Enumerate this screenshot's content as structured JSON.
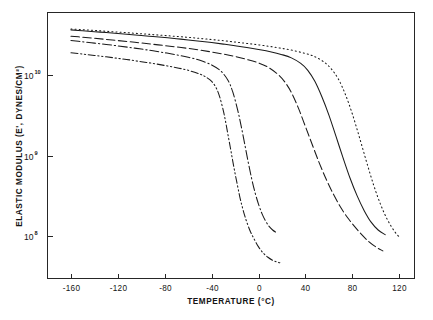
{
  "chart_data": {
    "type": "line",
    "title": "",
    "xlabel": "TEMPERATURE  (°C)",
    "ylabel": "ELASTIC MODULUS (E', DYNES/CM²)",
    "xlim": [
      -180,
      133
    ],
    "ylim": [
      30000000.0,
      60000000000.0
    ],
    "yscale": "log",
    "grid": false,
    "legend": "none",
    "xticks": [
      -160,
      -120,
      -80,
      -40,
      0,
      40,
      80,
      120
    ],
    "xtick_labels": [
      "-160",
      "-120",
      "-80",
      "-40",
      "0",
      "40",
      "80",
      "120"
    ],
    "yticks": [
      10000000000.0,
      1000000000.0,
      100000000.0
    ],
    "ytick_labels": [
      "10¹⁰",
      "10⁹",
      "10⁸"
    ],
    "ytick_base": "10",
    "ytick_exponents": [
      "10",
      "9",
      "8"
    ],
    "series": [
      {
        "name": "curve-1-dash-dot-dot",
        "style": "dash-dot-dot",
        "dasharray": "7,2.6,1.3,2.6,1.3,2.6",
        "x": [
          -160,
          -150,
          -140,
          -130,
          -120,
          -110,
          -100,
          -90,
          -80,
          -70,
          -60,
          -50,
          -45,
          -40,
          -36,
          -33,
          -30,
          -28,
          -26,
          -24,
          -22,
          -20,
          -18,
          -16,
          -14,
          -12,
          -10,
          -7,
          -4,
          0,
          4,
          8,
          12,
          16,
          20
        ],
        "y": [
          19000000000.0,
          18300000000.0,
          17600000000.0,
          16900000000.0,
          16200000000.0,
          15500000000.0,
          14700000000.0,
          14000000000.0,
          13200000000.0,
          12400000000.0,
          11500000000.0,
          10300000000.0,
          9500000000.0,
          8400000000.0,
          6900000000.0,
          5300000000.0,
          3600000000.0,
          2600000000.0,
          1800000000.0,
          1250000000.0,
          860000000.0,
          600000000.0,
          430000000.0,
          310000000.0,
          235000000.0,
          185000000.0,
          150000000.0,
          115000000.0,
          94000000.0,
          74000000.0,
          62000000.0,
          55000000.0,
          50500000.0,
          48000000.0,
          46500000.0
        ]
      },
      {
        "name": "curve-2-dash-dot",
        "style": "dash-dot",
        "dasharray": "9,2.8,1.3,2.8",
        "x": [
          -160,
          -150,
          -140,
          -130,
          -120,
          -110,
          -100,
          -90,
          -80,
          -70,
          -60,
          -50,
          -40,
          -32,
          -26,
          -22,
          -18,
          -15,
          -12,
          -9,
          -6,
          -3,
          0,
          3,
          6,
          9,
          12,
          15
        ],
        "y": [
          27000000000.0,
          26000000000.0,
          25000000000.0,
          24100000000.0,
          23100000000.0,
          22100000000.0,
          21100000000.0,
          20100000000.0,
          19000000000.0,
          17900000000.0,
          16700000000.0,
          15300000000.0,
          13400000000.0,
          11200000000.0,
          8600000000.0,
          6200000000.0,
          3800000000.0,
          2400000000.0,
          1450000000.0,
          860000000.0,
          530000000.0,
          350000000.0,
          250000000.0,
          190000000.0,
          155000000.0,
          133000000.0,
          120000000.0,
          112000000.0
        ]
      },
      {
        "name": "curve-3-dashed",
        "style": "dashed",
        "dasharray": "8.5,3.4",
        "x": [
          -160,
          -150,
          -140,
          -130,
          -120,
          -110,
          -100,
          -90,
          -80,
          -70,
          -60,
          -50,
          -40,
          -30,
          -20,
          -10,
          0,
          8,
          16,
          22,
          28,
          34,
          40,
          46,
          52,
          58,
          64,
          70,
          76,
          82,
          88,
          94,
          100,
          106
        ],
        "y": [
          30500000000.0,
          29600000000.0,
          28700000000.0,
          27800000000.0,
          26900000000.0,
          26000000000.0,
          25100000000.0,
          24200000000.0,
          23300000000.0,
          22400000000.0,
          21500000000.0,
          20500000000.0,
          19400000000.0,
          18300000000.0,
          17100000000.0,
          15700000000.0,
          14200000000.0,
          12600000000.0,
          10400000000.0,
          8400000000.0,
          6100000000.0,
          3900000000.0,
          2300000000.0,
          1350000000.0,
          800000000.0,
          500000000.0,
          330000000.0,
          230000000.0,
          170000000.0,
          132000000.0,
          105000000.0,
          86000000.0,
          74000000.0,
          66000000.0
        ]
      },
      {
        "name": "curve-4-solid",
        "style": "solid",
        "dasharray": "0",
        "x": [
          -160,
          -150,
          -140,
          -130,
          -120,
          -110,
          -100,
          -90,
          -80,
          -70,
          -60,
          -50,
          -40,
          -30,
          -20,
          -10,
          0,
          10,
          20,
          28,
          36,
          42,
          48,
          54,
          60,
          66,
          72,
          78,
          84,
          90,
          96,
          102,
          108
        ],
        "y": [
          36500000000.0,
          35600000000.0,
          34700000000.0,
          33800000000.0,
          32900000000.0,
          32000000000.0,
          31100000000.0,
          30200000000.0,
          29300000000.0,
          28400000000.0,
          27400000000.0,
          26400000000.0,
          25400000000.0,
          24300000000.0,
          23200000000.0,
          22100000000.0,
          20900000000.0,
          19600000000.0,
          18000000000.0,
          16400000000.0,
          14000000000.0,
          11500000000.0,
          8400000000.0,
          5400000000.0,
          3200000000.0,
          1750000000.0,
          950000000.0,
          530000000.0,
          320000000.0,
          210000000.0,
          150000000.0,
          120000000.0,
          105000000.0
        ]
      },
      {
        "name": "curve-5-dotted",
        "style": "dotted",
        "dasharray": "1.1,3.0",
        "x": [
          -160,
          -150,
          -140,
          -130,
          -120,
          -110,
          -100,
          -90,
          -80,
          -70,
          -60,
          -50,
          -40,
          -30,
          -20,
          -10,
          0,
          10,
          20,
          30,
          40,
          48,
          56,
          62,
          68,
          74,
          80,
          86,
          92,
          98,
          104,
          110,
          116,
          121
        ],
        "y": [
          37500000000.0,
          36700000000.0,
          35900000000.0,
          35100000000.0,
          34300000000.0,
          33500000000.0,
          32700000000.0,
          31900000000.0,
          31100000000.0,
          30300000000.0,
          29500000000.0,
          28600000000.0,
          27700000000.0,
          26800000000.0,
          25800000000.0,
          24800000000.0,
          23800000000.0,
          22700000000.0,
          21500000000.0,
          20200000000.0,
          18600000000.0,
          17000000000.0,
          14500000000.0,
          12000000000.0,
          9000000000.0,
          5800000000.0,
          3300000000.0,
          1700000000.0,
          850000000.0,
          440000000.0,
          250000000.0,
          160000000.0,
          115000000.0,
          95000000.0
        ]
      }
    ]
  },
  "axes": {
    "x_title": "TEMPERATURE  (°C)",
    "y_title": "ELASTIC MODULUS (E', DYNES/CM²)"
  },
  "colors": {
    "ink": "#1a1a1a",
    "background": "#ffffff"
  }
}
